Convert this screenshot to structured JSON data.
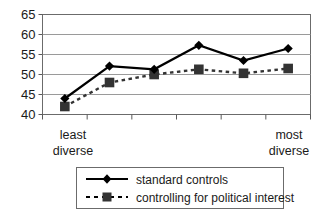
{
  "chart_data": {
    "type": "line",
    "title": "",
    "xlabel": "",
    "ylabel": "",
    "ylim": [
      40,
      65
    ],
    "yticks": [
      40,
      45,
      50,
      55,
      60,
      65
    ],
    "ytick_labels": [
      "40",
      "45",
      "50",
      "55",
      "60",
      "65"
    ],
    "grid": true,
    "grid_axis": "y",
    "legend_position": "bottom",
    "x": [
      1,
      2,
      3,
      4,
      5,
      6
    ],
    "categories": [
      "",
      "",
      "",
      "",
      "",
      ""
    ],
    "x_axis_endpoint_labels": {
      "left_line1": "least",
      "left_line2": "diverse",
      "right_line1": "most",
      "right_line2": "diverse"
    },
    "series": [
      {
        "name": "standard controls",
        "marker": "diamond",
        "linestyle": "solid",
        "color": "#000000",
        "values": [
          44.0,
          52.1,
          51.3,
          57.3,
          53.5,
          56.5
        ]
      },
      {
        "name": "controlling for political interest",
        "marker": "square",
        "linestyle": "dashed",
        "color": "#333333",
        "values": [
          42.0,
          48.0,
          50.0,
          51.3,
          50.3,
          51.5
        ]
      }
    ]
  },
  "legend": {
    "entries": [
      {
        "label": "standard controls",
        "marker": "diamond-marker-icon",
        "style": "solid"
      },
      {
        "label": "controlling for political interest",
        "marker": "square-marker-icon",
        "style": "dashed"
      }
    ]
  },
  "colors": {
    "line": "#000000",
    "grid": "#9a9a9a",
    "axis": "#5a5a5a",
    "background": "#ffffff",
    "text": "#1a1a1a"
  }
}
